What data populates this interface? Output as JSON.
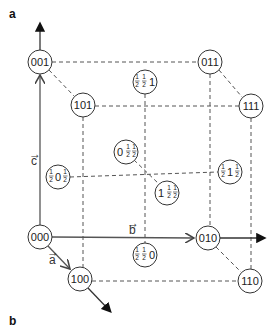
{
  "panels": {
    "a_label": "a",
    "b_label": "b"
  },
  "axes": {
    "a": {
      "label": "a",
      "symbol": "→"
    },
    "b": {
      "label": "b",
      "symbol": "→"
    },
    "c": {
      "label": "c",
      "symbol": "→"
    }
  },
  "corner_nodes": [
    {
      "id": "000",
      "label": "000",
      "x": 40,
      "y": 237
    },
    {
      "id": "010",
      "label": "010",
      "x": 208,
      "y": 238
    },
    {
      "id": "100",
      "label": "100",
      "x": 80,
      "y": 279
    },
    {
      "id": "110",
      "label": "110",
      "x": 250,
      "y": 281
    },
    {
      "id": "001",
      "label": "001",
      "x": 40,
      "y": 62
    },
    {
      "id": "011",
      "label": "011",
      "x": 210,
      "y": 62
    },
    {
      "id": "101",
      "label": "101",
      "x": 83,
      "y": 105
    },
    {
      "id": "111",
      "label": "111",
      "x": 251,
      "y": 106
    }
  ],
  "face_center_nodes": [
    {
      "id": "half-half-1",
      "parts": [
        "½",
        "½",
        "1"
      ],
      "x": 145,
      "y": 82
    },
    {
      "id": "0-half-half",
      "parts": [
        "0",
        "½",
        "½"
      ],
      "x": 126,
      "y": 152
    },
    {
      "id": "1-half-half",
      "parts": [
        "1",
        "½",
        "½"
      ],
      "x": 167,
      "y": 193
    },
    {
      "id": "half-0-half",
      "parts": [
        "½",
        "0",
        "½"
      ],
      "x": 58,
      "y": 177
    },
    {
      "id": "half-1-half",
      "parts": [
        "½",
        "1",
        "½"
      ],
      "x": 230,
      "y": 172
    },
    {
      "id": "half-half-0",
      "parts": [
        "½",
        "½",
        "0"
      ],
      "x": 145,
      "y": 255
    }
  ],
  "colors": {
    "line": "#555555",
    "dashed": "#555555",
    "node_stroke": "#333333",
    "background": "#ffffff"
  }
}
